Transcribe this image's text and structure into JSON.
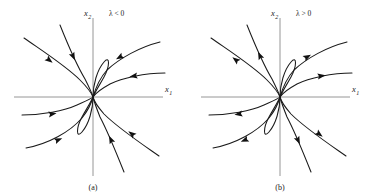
{
  "figure": {
    "background": "#ffffff",
    "curve_color": "#1a1a1a",
    "axis_color": "#8a8a8a"
  },
  "panels": [
    {
      "id": "a",
      "caption": "(a)",
      "parameter_label": "λ < 0",
      "parameter_symbol": "λ",
      "parameter_relation": "<",
      "parameter_value": "0",
      "stability": "stable",
      "flow_direction": "inward",
      "axes": {
        "x_label": "x",
        "x_subscript": "1",
        "y_label": "x",
        "y_subscript": "2"
      }
    },
    {
      "id": "b",
      "caption": "(b)",
      "parameter_label": "λ > 0",
      "parameter_symbol": "λ",
      "parameter_relation": ">",
      "parameter_value": "0",
      "stability": "unstable",
      "flow_direction": "outward",
      "axes": {
        "x_label": "x",
        "x_subscript": "1",
        "y_label": "x",
        "y_subscript": "2"
      }
    }
  ],
  "chart_data": {
    "type": "line",
    "xlabel": "x1",
    "ylabel": "x2",
    "xlim": [
      -1,
      1
    ],
    "ylim": [
      -1,
      1
    ],
    "grid": false,
    "legend": "none",
    "origin": {
      "x": 93,
      "y": 97
    },
    "axis_extent": {
      "x_start": 14,
      "x_end": 163,
      "y_start": 18,
      "y_end": 176
    },
    "annotations": [
      "λ < 0",
      "λ > 0",
      "(a)",
      "(b)"
    ],
    "trajectories": [
      {
        "name": "upper-left-outer",
        "path": "M 24,38 C 44,52 66,66 80,80 C 87,87 91,92 93,97",
        "arrow_at": [
          49,
          60
        ],
        "arrow_angle_inward": 38,
        "arrow_angle_outward": 218
      },
      {
        "name": "upper-left-steep",
        "path": "M 60,25 C 68,45 76,64 85,79 C 89,87 92,93 93,97",
        "arrow_at": [
          73,
          56
        ],
        "arrow_angle_inward": 65,
        "arrow_angle_outward": 245
      },
      {
        "name": "upper-axis-loop",
        "path": "M 93,97 C 93,85 97,70 104,62 C 110,55 110,66 104,77 C 99,86 95,92 93,97",
        "arrow_at": null,
        "arrow_angle_inward": null,
        "arrow_angle_outward": null
      },
      {
        "name": "upper-right-outer",
        "path": "M 160,42 C 140,47 120,58 107,70 C 99,79 95,90 93,97",
        "arrow_at": [
          120,
          57
        ],
        "arrow_angle_inward": 150,
        "arrow_angle_outward": 330
      },
      {
        "name": "right-upper-flat",
        "path": "M 165,73 C 145,73 122,78 110,84 C 101,89 95,94 93,97",
        "arrow_at": [
          134,
          76
        ],
        "arrow_angle_inward": 172,
        "arrow_angle_outward": 352
      },
      {
        "name": "left-lower-flat",
        "path": "M 22,115 C 42,115 64,111 77,105 C 86,101 91,99 93,97",
        "arrow_at": [
          52,
          114
        ],
        "arrow_angle_inward": -8,
        "arrow_angle_outward": 172
      },
      {
        "name": "lower-left-outer",
        "path": "M 26,148 C 48,144 70,132 82,118 C 89,109 92,101 93,97",
        "arrow_at": [
          58,
          140
        ],
        "arrow_angle_inward": -22,
        "arrow_angle_outward": 158
      },
      {
        "name": "lower-axis-loop",
        "path": "M 93,97 C 93,109 89,124 82,132 C 76,139 76,128 82,117 C 87,108 91,102 93,97",
        "arrow_at": null,
        "arrow_angle_inward": null,
        "arrow_angle_outward": null
      },
      {
        "name": "lower-center-steep",
        "path": "M 124,172 C 116,152 108,132 100,117 C 96,107 94,101 93,97",
        "arrow_at": [
          111,
          140
        ],
        "arrow_angle_inward": -115,
        "arrow_angle_outward": 65
      },
      {
        "name": "lower-right-outer",
        "path": "M 159,156 C 139,142 118,128 104,114 C 97,106 94,101 93,97",
        "arrow_at": [
          132,
          134
        ],
        "arrow_angle_inward": -143,
        "arrow_angle_outward": 37
      }
    ]
  }
}
